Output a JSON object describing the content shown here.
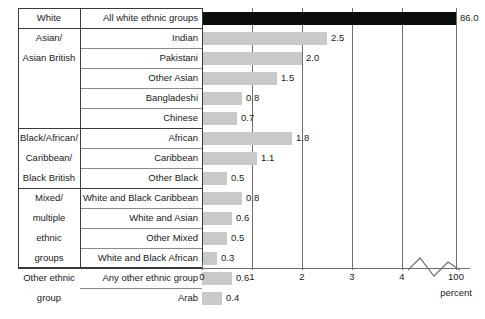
{
  "chart_data": {
    "type": "bar",
    "orientation": "horizontal",
    "title": "",
    "xlabel": "percent",
    "ylabel": "",
    "xlim": [
      0,
      4.4
    ],
    "grid": true,
    "legend": null,
    "axis_break": {
      "present": true,
      "after_tick": "4",
      "resumes_at": "100"
    },
    "tick_labels": [
      "0",
      "1",
      "2",
      "3",
      "4",
      "100"
    ],
    "tick_values": [
      0,
      1,
      2,
      3,
      4,
      100
    ],
    "group_header": "",
    "categories": [
      "All white ethnic groups",
      "Indian",
      "Pakistani",
      "Other Asian",
      "Bangladeshi",
      "Chinese",
      "African",
      "Caribbean",
      "Other Black",
      "White and Black Caribbean",
      "White and Asian",
      "Other Mixed",
      "White and Black African",
      "Any other ethnic group",
      "Arab"
    ],
    "values": [
      86.0,
      2.5,
      2.0,
      1.5,
      0.8,
      0.7,
      1.8,
      1.1,
      0.5,
      0.8,
      0.6,
      0.5,
      0.3,
      0.6,
      0.4
    ],
    "value_labels": [
      "86.0",
      "2.5",
      "2.0",
      "1.5",
      "0.8",
      "0.7",
      "1.8",
      "1.1",
      "0.5",
      "0.8",
      "0.6",
      "0.5",
      "0.3",
      "0.6",
      "0.4"
    ],
    "colors": {
      "highlight_bar": "#0d0d0d",
      "bar": "#c9c9c9",
      "gridline": "#6f6f6f",
      "frame": "#3a3a3a",
      "text": "#1a1a1a"
    },
    "groups": [
      {
        "name": "White",
        "rows": 1
      },
      {
        "name": "Asian/ Asian British",
        "rows": 5
      },
      {
        "name": "Black/African/ Caribbean/ Black British",
        "rows": 3
      },
      {
        "name": "Mixed/ multiple ethnic groups",
        "rows": 4
      },
      {
        "name": "Other ethnic group",
        "rows": 2
      }
    ]
  },
  "table": {
    "rows": [
      {
        "group": "White",
        "label": "All white ethnic groups",
        "value_label": "86.0",
        "value": 86.0,
        "dark": true,
        "group_start": true
      },
      {
        "group": "Asian/",
        "label": "Indian",
        "value_label": "2.5",
        "value": 2.5,
        "dark": false,
        "group_start": true
      },
      {
        "group": "Asian British",
        "label": "Pakistani",
        "value_label": "2.0",
        "value": 2.0,
        "dark": false,
        "group_start": false
      },
      {
        "group": "",
        "label": "Other Asian",
        "value_label": "1.5",
        "value": 1.5,
        "dark": false,
        "group_start": false
      },
      {
        "group": "",
        "label": "Bangladeshi",
        "value_label": "0.8",
        "value": 0.8,
        "dark": false,
        "group_start": false
      },
      {
        "group": "",
        "label": "Chinese",
        "value_label": "0.7",
        "value": 0.7,
        "dark": false,
        "group_start": false
      },
      {
        "group": "Black/African/",
        "label": "African",
        "value_label": "1.8",
        "value": 1.8,
        "dark": false,
        "group_start": true
      },
      {
        "group": "Caribbean/",
        "label": "Caribbean",
        "value_label": "1.1",
        "value": 1.1,
        "dark": false,
        "group_start": false
      },
      {
        "group": "Black British",
        "label": "Other Black",
        "value_label": "0.5",
        "value": 0.5,
        "dark": false,
        "group_start": false
      },
      {
        "group": "Mixed/",
        "label": "White and Black Caribbean",
        "value_label": "0.8",
        "value": 0.8,
        "dark": false,
        "group_start": true
      },
      {
        "group": "multiple",
        "label": "White and Asian",
        "value_label": "0.6",
        "value": 0.6,
        "dark": false,
        "group_start": false
      },
      {
        "group": "ethnic",
        "label": "Other Mixed",
        "value_label": "0.5",
        "value": 0.5,
        "dark": false,
        "group_start": false
      },
      {
        "group": "groups",
        "label": "White and Black African",
        "value_label": "0.3",
        "value": 0.3,
        "dark": false,
        "group_start": false
      },
      {
        "group": "Other ethnic",
        "label": "Any other ethnic group",
        "value_label": "0.6",
        "value": 0.6,
        "dark": false,
        "group_start": true
      },
      {
        "group": "group",
        "label": "Arab",
        "value_label": "0.4",
        "value": 0.4,
        "dark": false,
        "group_start": false
      }
    ]
  },
  "axis": {
    "ticks": [
      {
        "label": "0",
        "x": 202
      },
      {
        "label": "1",
        "x": 252
      },
      {
        "label": "2",
        "x": 302
      },
      {
        "label": "3",
        "x": 352
      },
      {
        "label": "4",
        "x": 402
      },
      {
        "label": "100",
        "x": 456
      }
    ],
    "unit_label": "percent"
  }
}
